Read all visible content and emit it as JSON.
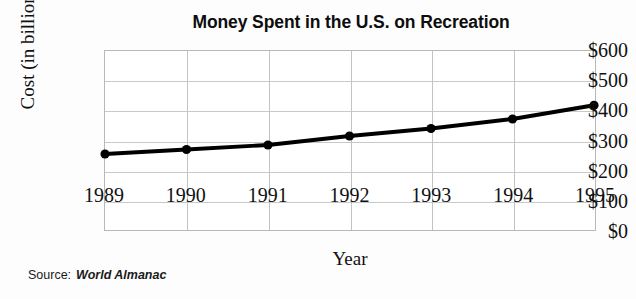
{
  "chart_data": {
    "type": "line",
    "title": "Money Spent in the U.S. on Recreation",
    "xlabel": "Year",
    "ylabel": "Cost (in billions)",
    "categories": [
      "1989",
      "1990",
      "1991",
      "1992",
      "1993",
      "1994",
      "1995"
    ],
    "x": [
      1989,
      1990,
      1991,
      1992,
      1993,
      1994,
      1995
    ],
    "values": [
      255,
      270,
      285,
      315,
      340,
      372,
      418
    ],
    "series": [
      {
        "name": "Money spent on recreation",
        "values": [
          255,
          270,
          285,
          315,
          340,
          372,
          418
        ]
      }
    ],
    "ylim": [
      0,
      600
    ],
    "xlim": [
      1989,
      1995
    ],
    "ytick_labels": [
      "$0",
      "$100",
      "$200",
      "$300",
      "$400",
      "$500",
      "$600"
    ],
    "ytick_values": [
      0,
      100,
      200,
      300,
      400,
      500,
      600
    ],
    "xtick_labels": [
      "1989",
      "1990",
      "1991",
      "1992",
      "1993",
      "1994",
      "1995"
    ],
    "grid": true,
    "legend": "none",
    "line_color": "#000000",
    "marker": "circle",
    "marker_color": "#000000"
  },
  "source": {
    "label": "Source:",
    "value": "World Almanac"
  },
  "colors": {
    "line": "#000000",
    "grid": "#c9c9c9",
    "axis_border": "#b8b8b8",
    "text": "#111111",
    "background": "#fdfdfd"
  }
}
